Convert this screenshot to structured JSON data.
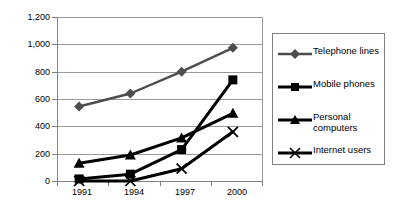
{
  "chart_data": {
    "type": "line",
    "title": "",
    "xlabel": "",
    "ylabel": "",
    "categories": [
      "1991",
      "1994",
      "1997",
      "2000"
    ],
    "ylim": [
      0,
      1200
    ],
    "yticks": [
      "0",
      "200",
      "400",
      "600",
      "800",
      "1,000",
      "1,200"
    ],
    "ytick_values": [
      0,
      200,
      400,
      600,
      800,
      1000,
      1200
    ],
    "grid": true,
    "legend_position": "right",
    "series": [
      {
        "name": "Telephone lines",
        "marker": "diamond",
        "color": "#4d4d4d",
        "values": [
          545,
          640,
          800,
          975
        ]
      },
      {
        "name": "Mobile phones",
        "marker": "square",
        "color": "#000000",
        "values": [
          15,
          50,
          230,
          740
        ]
      },
      {
        "name": "Personal computers",
        "marker": "triangle",
        "color": "#000000",
        "values": [
          130,
          190,
          315,
          495
        ]
      },
      {
        "name": "Internet users",
        "marker": "cross",
        "color": "#000000",
        "values": [
          0,
          0,
          90,
          360
        ]
      }
    ]
  },
  "legend": {
    "items": [
      {
        "label": "Telephone lines",
        "marker": "diamond-marker-icon"
      },
      {
        "label": "Mobile phones",
        "marker": "square-marker-icon"
      },
      {
        "label": "Personal\ncomputers",
        "marker": "triangle-marker-icon"
      },
      {
        "label": "Internet users",
        "marker": "cross-marker-icon"
      }
    ]
  },
  "axis": {
    "y_ticks": [
      "1,200",
      "1,000",
      "800",
      "600",
      "400",
      "200",
      "0"
    ],
    "x_ticks": [
      "1991",
      "1994",
      "1997",
      "2000"
    ]
  }
}
